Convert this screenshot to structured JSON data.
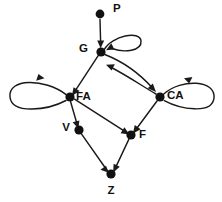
{
  "figure": {
    "kind": "directed-graph-diagram",
    "background_color": "#ffffff",
    "ink_color": "#111111",
    "width": 222,
    "height": 202
  },
  "nodes": [
    {
      "id": "P",
      "label": "P",
      "x": 100,
      "y": 14,
      "r": 4.4,
      "label_x": 113,
      "label_y": 9,
      "anchor": "start"
    },
    {
      "id": "G",
      "label": "G",
      "x": 101,
      "y": 52,
      "r": 4.6,
      "label_x": 88,
      "label_y": 49,
      "anchor": "end"
    },
    {
      "id": "FA",
      "label": "FA",
      "x": 70,
      "y": 97,
      "r": 4.6,
      "label_x": 76,
      "label_y": 97,
      "anchor": "start"
    },
    {
      "id": "CA",
      "label": "CA",
      "x": 160,
      "y": 97,
      "r": 4.6,
      "label_x": 167,
      "label_y": 96,
      "anchor": "start"
    },
    {
      "id": "V",
      "label": "V",
      "x": 79,
      "y": 130,
      "r": 4.6,
      "label_x": 70,
      "label_y": 128,
      "anchor": "end"
    },
    {
      "id": "F",
      "label": "F",
      "x": 131,
      "y": 135,
      "r": 4.6,
      "label_x": 139,
      "label_y": 135,
      "anchor": "start"
    },
    {
      "id": "Z",
      "label": "Z",
      "x": 111,
      "y": 174,
      "r": 4.6,
      "label_x": 111,
      "label_y": 191,
      "anchor": "middle"
    }
  ],
  "edges": [
    {
      "id": "P-G",
      "from": "P",
      "to": "G",
      "kind": "straight",
      "label": ""
    },
    {
      "id": "G-self",
      "from": "G",
      "to": "G",
      "kind": "self-loop",
      "label": ""
    },
    {
      "id": "G-FA",
      "from": "G",
      "to": "FA",
      "kind": "straight",
      "label": ""
    },
    {
      "id": "G-CA",
      "from": "G",
      "to": "CA",
      "kind": "curve",
      "label": ""
    },
    {
      "id": "CA-G",
      "from": "CA",
      "to": "G",
      "kind": "curve",
      "label": ""
    },
    {
      "id": "FA-self",
      "from": "FA",
      "to": "FA",
      "kind": "self-loop",
      "label": ""
    },
    {
      "id": "CA-self",
      "from": "CA",
      "to": "CA",
      "kind": "self-loop",
      "label": ""
    },
    {
      "id": "FA-V",
      "from": "FA",
      "to": "V",
      "kind": "straight",
      "label": ""
    },
    {
      "id": "FA-F",
      "from": "FA",
      "to": "F",
      "kind": "straight",
      "label": ""
    },
    {
      "id": "CA-F",
      "from": "CA",
      "to": "F",
      "kind": "straight",
      "label": ""
    },
    {
      "id": "V-Z",
      "from": "V",
      "to": "Z",
      "kind": "straight",
      "label": ""
    },
    {
      "id": "F-Z",
      "from": "F",
      "to": "Z",
      "kind": "straight",
      "label": ""
    }
  ],
  "geometry": {
    "edge_P_G": {
      "d": "M 100 19.5 L 100.7 44.8"
    },
    "arrow_P_G": {
      "points": "100.6,48.2 97.2,40.6 104.2,40.6"
    },
    "edge_G_self": {
      "d": "M 104.5 49.2 C 112 36, 140 30, 141 41 C 142 51, 124 53, 112 48.5"
    },
    "arrow_G_self": {
      "points": "106.0,50.2 114.4,49.6 111.3,43.3"
    },
    "edge_G_FA": {
      "d": "M 98.2 55.6 L 74.0 92.6"
    },
    "arrow_G_FA": {
      "points": "71.8,96.0 73.6,87.2 79.6,91.0"
    },
    "edge_G_CA": {
      "d": "M 104.8 54.5 C 124 62, 140 74, 153 88.5"
    },
    "arrow_G_CA": {
      "points": "156.0,92.0 147.7,88.2 152.8,83.4"
    },
    "edge_CA_G": {
      "d": "M 156.0 94.0 C 142 86, 128 76, 109.5 66.5"
    },
    "arrow_CA_G": {
      "points": "106.0,64.8 114.8,64.2 111.6,70.6"
    },
    "edge_FA_self": {
      "d": "M 66.2 94.6 C 44 78, 8 78, 10 97 C 12 115, 48 110, 66 100.5"
    },
    "arrow_FA_self": {
      "points": "44.5,78.2 36.2,80.8 38.4,74.0"
    },
    "edge_CA_self": {
      "d": "M 163.5 94.2 C 182 78, 216 80, 214 98 C 212 115, 180 109, 164.2 100.6"
    },
    "arrow_CA_self": {
      "points": "184.0,78.2 192.4,77.0 189.2,83.6"
    },
    "edge_FA_V": {
      "d": "M 70.6 101.8 L 77.4 125.2"
    },
    "arrow_FA_V": {
      "points": "78.4,128.6 72.6,122.2 79.4,120.4"
    },
    "edge_FA_F": {
      "d": "M 74.5 99.2 L 126.4 132.4"
    },
    "arrow_FA_F": {
      "points": "129.4,134.4 120.6,133.2 124.4,127.2"
    },
    "edge_CA_F": {
      "d": "M 157.0 101.0 L 135.0 130.8"
    },
    "arrow_CA_F": {
      "points": "132.8,133.8 134.8,125.0 140.6,129.2"
    },
    "edge_V_Z": {
      "d": "M 81.6 134.2 L 106.8 170.0"
    },
    "arrow_V_Z": {
      "points": "108.8,172.8 100.4,169.8 106.0,165.8"
    },
    "edge_F_Z": {
      "d": "M 128.8 139.4 L 114.6 169.6"
    },
    "arrow_F_Z": {
      "points": "113.2,172.6 113.6,163.8 119.8,166.8"
    }
  }
}
